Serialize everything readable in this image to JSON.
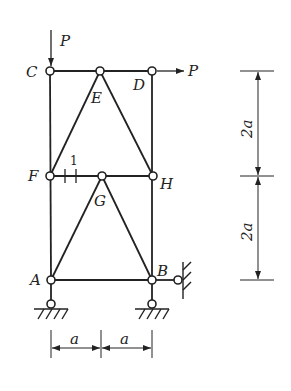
{
  "diagram": {
    "type": "truss",
    "nodes": {
      "C": {
        "label": "C",
        "x": 50,
        "y": 71
      },
      "E": {
        "label": "E",
        "x": 100,
        "y": 71
      },
      "D": {
        "label": "D",
        "x": 152,
        "y": 71
      },
      "F": {
        "label": "F",
        "x": 50,
        "y": 176
      },
      "G": {
        "label": "G",
        "x": 102,
        "y": 176
      },
      "H": {
        "label": "H",
        "x": 153,
        "y": 176
      },
      "A": {
        "label": "A",
        "x": 51,
        "y": 280
      },
      "B": {
        "label": "B",
        "x": 152,
        "y": 280
      }
    },
    "loads": [
      {
        "label": "P",
        "at": "C",
        "direction": "down"
      },
      {
        "label": "P",
        "at": "D",
        "direction": "right"
      }
    ],
    "member_marker": {
      "label": "1",
      "member": "F-G"
    },
    "dimensions": {
      "horizontal": [
        "a",
        "a"
      ],
      "vertical": [
        "2a",
        "2a"
      ]
    },
    "colors": {
      "line": "#222222",
      "background": "#ffffff"
    }
  }
}
